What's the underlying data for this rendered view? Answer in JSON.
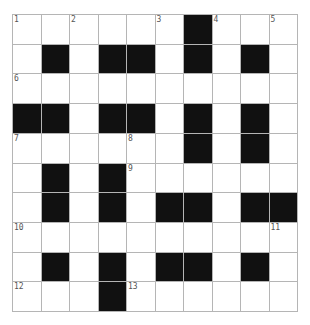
{
  "puzzle": {
    "rows": 10,
    "cols": 10,
    "colors": {
      "block": "#111111",
      "cell": "#ffffff",
      "gridline": "#b5b5b5",
      "number": "#555555"
    },
    "layout": [
      "......#...",
      ".#.##.#.#.",
      "..........",
      "##.##.#.#.",
      "......#.#.",
      ".#.#......",
      ".#.#.##.##",
      "..........",
      ".#.#.##.#.",
      "...#......"
    ],
    "numbers": [
      {
        "row": 0,
        "col": 0,
        "n": "1"
      },
      {
        "row": 0,
        "col": 2,
        "n": "2"
      },
      {
        "row": 0,
        "col": 5,
        "n": "3"
      },
      {
        "row": 0,
        "col": 7,
        "n": "4"
      },
      {
        "row": 0,
        "col": 9,
        "n": "5"
      },
      {
        "row": 2,
        "col": 0,
        "n": "6"
      },
      {
        "row": 4,
        "col": 0,
        "n": "7"
      },
      {
        "row": 4,
        "col": 4,
        "n": "8"
      },
      {
        "row": 5,
        "col": 4,
        "n": "9"
      },
      {
        "row": 7,
        "col": 0,
        "n": "10"
      },
      {
        "row": 7,
        "col": 9,
        "n": "11"
      },
      {
        "row": 9,
        "col": 0,
        "n": "12"
      },
      {
        "row": 9,
        "col": 4,
        "n": "13"
      }
    ],
    "entries": []
  }
}
